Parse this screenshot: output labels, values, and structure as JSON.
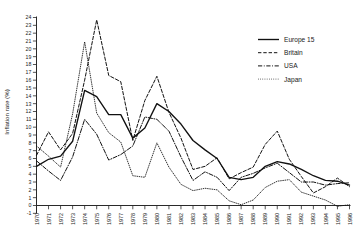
{
  "chart_data": {
    "type": "line",
    "title": "",
    "subtitle": "",
    "xlabel": "",
    "ylabel": "Inflation rate (%)",
    "grid": false,
    "legend_position": "top-right",
    "xlim": [
      1970,
      1996
    ],
    "ylim": [
      -1,
      24
    ],
    "ytick_step": 1,
    "yticks": [
      -1,
      0,
      1,
      2,
      3,
      4,
      5,
      6,
      7,
      8,
      9,
      10,
      11,
      12,
      13,
      14,
      15,
      16,
      17,
      18,
      19,
      20,
      21,
      22,
      23,
      24
    ],
    "ytick_labels": [
      "-1",
      "0",
      "1",
      "2",
      "3",
      "4",
      "5",
      "6",
      "7",
      "8",
      "9",
      "10",
      "11",
      "12",
      "13",
      "14",
      "15",
      "16",
      "17",
      "18",
      "19",
      "20",
      "21",
      "22",
      "23",
      "24"
    ],
    "x": [
      1970,
      1971,
      1972,
      1973,
      1974,
      1975,
      1976,
      1977,
      1978,
      1979,
      1980,
      1981,
      1982,
      1983,
      1984,
      1985,
      1986,
      1987,
      1988,
      1989,
      1990,
      1991,
      1992,
      1993,
      1994,
      1995,
      1996
    ],
    "xtick_labels": [
      "1970",
      "1971",
      "1972",
      "1973",
      "1974",
      "1975",
      "1976",
      "1977",
      "1978",
      "1979",
      "1980",
      "1981",
      "1982",
      "1983",
      "1984",
      "1985",
      "1986",
      "1987",
      "1988",
      "1989",
      "1990",
      "1991",
      "1992",
      "1993",
      "1994",
      "1995",
      "1996"
    ],
    "series": [
      {
        "name": "Europe 15",
        "style": "solid",
        "color": "#111111",
        "values": [
          5.0,
          5.9,
          6.3,
          8.2,
          14.7,
          13.9,
          11.6,
          11.6,
          8.6,
          9.9,
          13.0,
          12.0,
          10.4,
          8.3,
          7.1,
          6.0,
          3.6,
          3.3,
          3.6,
          5.0,
          5.6,
          5.3,
          4.6,
          3.8,
          3.2,
          3.1,
          2.6
        ]
      },
      {
        "name": "Britain",
        "style": "dashed",
        "color": "#111111",
        "values": [
          6.4,
          9.4,
          7.1,
          9.2,
          16.0,
          23.7,
          16.6,
          15.8,
          8.3,
          13.4,
          16.5,
          11.9,
          8.6,
          4.6,
          5.0,
          6.1,
          3.4,
          4.2,
          4.9,
          7.8,
          9.5,
          5.9,
          3.7,
          1.6,
          2.4,
          3.5,
          2.4
        ]
      },
      {
        "name": "USA",
        "style": "dashdot",
        "color": "#111111",
        "values": [
          5.7,
          4.4,
          3.2,
          6.2,
          11.0,
          9.1,
          5.8,
          6.5,
          7.6,
          11.3,
          11.0,
          9.5,
          6.2,
          3.2,
          4.3,
          3.6,
          1.9,
          3.6,
          4.1,
          4.8,
          5.4,
          4.2,
          3.0,
          3.0,
          2.6,
          2.8,
          2.9
        ]
      },
      {
        "name": "Japan",
        "style": "dotted",
        "color": "#111111",
        "values": [
          7.6,
          6.3,
          4.9,
          11.7,
          20.9,
          11.8,
          9.3,
          8.1,
          3.8,
          3.6,
          8.0,
          4.9,
          2.7,
          1.9,
          2.2,
          2.0,
          0.6,
          0.1,
          0.7,
          2.3,
          3.1,
          3.3,
          1.7,
          1.2,
          0.7,
          -0.1,
          0.1
        ]
      }
    ]
  },
  "legend": {
    "items": [
      {
        "label": "Europe 15",
        "style": "solid"
      },
      {
        "label": "Britain",
        "style": "dashed"
      },
      {
        "label": "USA",
        "style": "dashdot"
      },
      {
        "label": "Japan",
        "style": "dotted"
      }
    ]
  }
}
